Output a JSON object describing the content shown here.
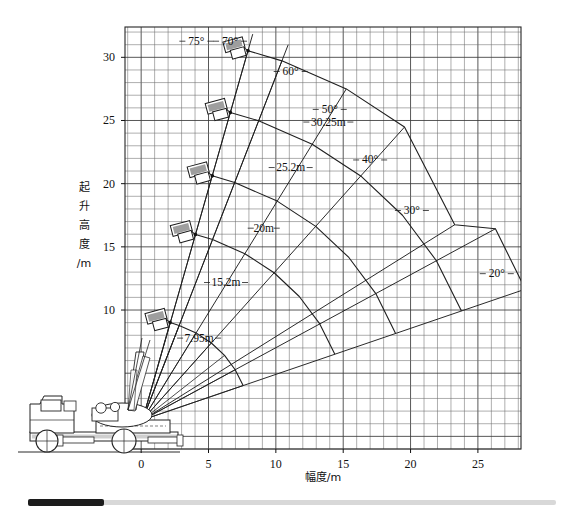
{
  "chart_data": {
    "type": "line",
    "title": "",
    "xlabel": "幅度/m",
    "ylabel": "起升高度/m",
    "xlim": [
      -1.2,
      28.2
    ],
    "ylim": [
      -1.0,
      32.4
    ],
    "xticks": [
      0,
      5,
      10,
      15,
      20,
      25
    ],
    "xtick_labels": [
      "0",
      "5",
      "10",
      "15",
      "20",
      "25"
    ],
    "yticks": [
      10,
      15,
      20,
      25,
      30
    ],
    "ytick_labels": [
      "10",
      "15",
      "20",
      "25",
      "30"
    ],
    "grid": true,
    "grid_step_x": 1,
    "grid_step_y": 1,
    "legend": "none",
    "pivot": {
      "x": 0.1,
      "y": 1.3
    },
    "boom_angle_labels": [
      "75°",
      "70°",
      "60°",
      "50°",
      "40°",
      "30°",
      "20°"
    ],
    "boom_angles_deg": [
      75,
      70,
      60,
      50,
      40,
      30,
      20
    ],
    "boom_length_labels": [
      "7.95m",
      "15.2m",
      "20m",
      "25.2m",
      "30.25m"
    ],
    "boom_lengths_m": [
      7.95,
      15.2,
      20,
      25.2,
      30.25
    ],
    "angle_label_positions": [
      {
        "label": "75°",
        "x": 4.1,
        "y": 31.0
      },
      {
        "label": "70°",
        "x": 6.6,
        "y": 31.0
      },
      {
        "label": "60°",
        "x": 11.1,
        "y": 28.6
      },
      {
        "label": "50°",
        "x": 14.0,
        "y": 25.6
      },
      {
        "label": "40°",
        "x": 17.0,
        "y": 21.6
      },
      {
        "label": "30°",
        "x": 20.1,
        "y": 17.6
      },
      {
        "label": "20°",
        "x": 26.4,
        "y": 12.6
      }
    ],
    "length_label_positions": [
      {
        "label": "7.95m",
        "x": 4.3,
        "y": 7.5
      },
      {
        "label": "15.2m",
        "x": 6.3,
        "y": 11.9
      },
      {
        "label": "20m",
        "x": 9.1,
        "y": 16.2
      },
      {
        "label": "25.2m",
        "x": 11.1,
        "y": 21.0
      },
      {
        "label": "30.25m",
        "x": 13.9,
        "y": 24.6
      }
    ],
    "series": [
      {
        "name": "7.95m boom arc",
        "length_m": 7.95,
        "points": [
          {
            "angle": 75,
            "x": 2.15,
            "y": 9.02
          },
          {
            "angle": 70,
            "x": 2.82,
            "y": 8.77
          },
          {
            "angle": 60,
            "x": 4.08,
            "y": 8.19
          },
          {
            "angle": 50,
            "x": 5.21,
            "y": 7.39
          },
          {
            "angle": 40,
            "x": 6.19,
            "y": 6.41
          },
          {
            "angle": 30,
            "x": 6.98,
            "y": 5.27
          },
          {
            "angle": 20,
            "x": 7.57,
            "y": 4.02
          }
        ]
      },
      {
        "name": "15.2m boom arc",
        "length_m": 15.2,
        "points": [
          {
            "angle": 75,
            "x": 4.03,
            "y": 15.98
          },
          {
            "angle": 70,
            "x": 5.3,
            "y": 15.58
          },
          {
            "angle": 60,
            "x": 7.7,
            "y": 14.46
          },
          {
            "angle": 50,
            "x": 9.87,
            "y": 12.95
          },
          {
            "angle": 40,
            "x": 11.74,
            "y": 11.07
          },
          {
            "angle": 30,
            "x": 13.26,
            "y": 8.9
          },
          {
            "angle": 20,
            "x": 14.38,
            "y": 6.5
          }
        ]
      },
      {
        "name": "20m boom arc",
        "length_m": 20,
        "points": [
          {
            "angle": 75,
            "x": 5.28,
            "y": 20.62
          },
          {
            "angle": 70,
            "x": 6.94,
            "y": 20.09
          },
          {
            "angle": 60,
            "x": 10.1,
            "y": 18.62
          },
          {
            "angle": 50,
            "x": 12.96,
            "y": 16.62
          },
          {
            "angle": 40,
            "x": 15.42,
            "y": 14.16
          },
          {
            "angle": 30,
            "x": 17.42,
            "y": 11.3
          },
          {
            "angle": 20,
            "x": 18.89,
            "y": 8.14
          }
        ]
      },
      {
        "name": "25.2m boom arc",
        "length_m": 25.2,
        "points": [
          {
            "angle": 75,
            "x": 6.62,
            "y": 25.64
          },
          {
            "angle": 70,
            "x": 8.72,
            "y": 24.98
          },
          {
            "angle": 60,
            "x": 12.7,
            "y": 23.12
          },
          {
            "angle": 50,
            "x": 16.3,
            "y": 20.61
          },
          {
            "angle": 40,
            "x": 19.4,
            "y": 17.5
          },
          {
            "angle": 30,
            "x": 21.92,
            "y": 13.9
          },
          {
            "angle": 20,
            "x": 23.78,
            "y": 9.92
          }
        ]
      },
      {
        "name": "30.25m boom arc",
        "length_m": 30.25,
        "points": [
          {
            "angle": 75,
            "x": 7.93,
            "y": 30.52
          },
          {
            "angle": 70,
            "x": 10.45,
            "y": 29.72
          },
          {
            "angle": 60,
            "x": 15.23,
            "y": 27.5
          },
          {
            "angle": 50,
            "x": 19.55,
            "y": 24.48
          },
          {
            "angle": 40,
            "x": 23.28,
            "y": 16.75
          },
          {
            "angle": 30,
            "x": 26.3,
            "y": 16.43
          },
          {
            "angle": 20,
            "x": 28.52,
            "y": 11.65
          }
        ]
      }
    ]
  },
  "axes": {
    "y_title": "起升高度\n/m",
    "y_title_chars": [
      "起",
      "升",
      "高",
      "度",
      "/m"
    ],
    "x_title": "幅度/m"
  },
  "illustration": {
    "name": "truck-mounted-crane",
    "parts": [
      "cab",
      "chassis",
      "outriggers",
      "wheels",
      "boom",
      "work-platform-baskets"
    ],
    "basket_count": 5
  },
  "scrollbar": {
    "orientation": "horizontal",
    "position": "bottom"
  }
}
